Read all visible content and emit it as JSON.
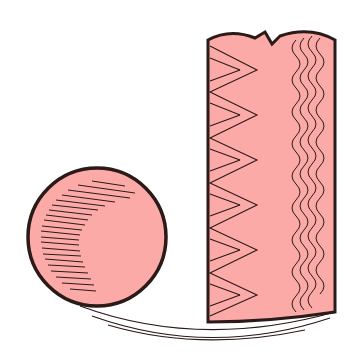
{
  "illustration": {
    "description": "Medical-style illustration: a pink spherical cell with hatched shading beside a pink tubular column showing zigzag and wavy internal patterns, resting on curved ground lines",
    "colors": {
      "fill": "#fbaaa8",
      "outline": "#2a1a18",
      "background": "#ffffff"
    },
    "elements": [
      {
        "name": "sphere",
        "shape": "circle",
        "hatching": "left-side crescent"
      },
      {
        "name": "column",
        "shape": "rounded-top rectangle with notch",
        "patterns": [
          "zigzag",
          "wavy-lines"
        ]
      },
      {
        "name": "ground-lines",
        "shape": "curved arcs",
        "count": 3
      }
    ]
  }
}
